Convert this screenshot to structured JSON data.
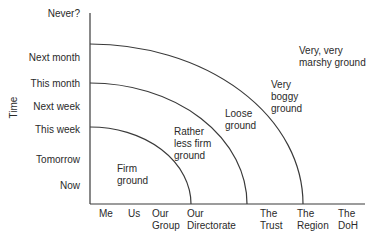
{
  "diagram": {
    "y_axis": {
      "title": "Time",
      "ticks": [
        "Never?",
        "Next month",
        "This month",
        "Next week",
        "This week",
        "Tomorrow",
        "Now"
      ]
    },
    "x_axis": {
      "ticks": [
        {
          "line1": "Me",
          "line2": ""
        },
        {
          "line1": "Us",
          "line2": ""
        },
        {
          "line1": "Our",
          "line2": "Group"
        },
        {
          "line1": "Our",
          "line2": "Directorate"
        },
        {
          "line1": "The",
          "line2": "Trust"
        },
        {
          "line1": "The",
          "line2": "Region"
        },
        {
          "line1": "The",
          "line2": "DoH"
        }
      ]
    },
    "regions": [
      {
        "line1": "Firm",
        "line2": "ground",
        "line3": ""
      },
      {
        "line1": "Rather",
        "line2": "less firm",
        "line3": "ground"
      },
      {
        "line1": "Loose",
        "line2": "ground",
        "line3": ""
      },
      {
        "line1": "Very",
        "line2": "boggy",
        "line3": "ground"
      },
      {
        "line1": "Very, very",
        "line2": "marshy ground",
        "line3": ""
      }
    ],
    "colors": {
      "line": "#3a3a3a",
      "text": "#2a2a2a",
      "background": "#ffffff"
    }
  }
}
